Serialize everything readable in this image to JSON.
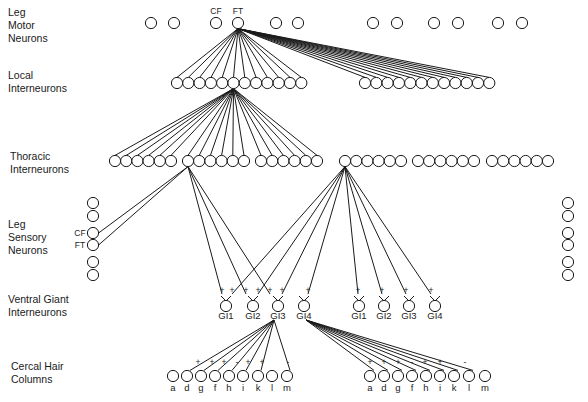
{
  "row_labels": {
    "motor": "Leg\nMotor\nNeurons",
    "local": "Local\nInterneurons",
    "thoracic": "Thoracic\nInterneurons",
    "sensory": "Leg\nSensory\nNeurons",
    "giant": "Ventral Giant\nInterneurons",
    "cercal": "Cercal Hair\nColumns"
  },
  "motor_neurons": {
    "y": 23,
    "x": [
      151,
      174,
      216,
      238,
      276,
      298,
      373,
      397,
      434,
      458,
      498,
      522
    ],
    "labels": [
      {
        "text": "CF",
        "x": 216
      },
      {
        "text": "FT",
        "x": 238
      }
    ],
    "source_index": 3
  },
  "local_interneurons": {
    "y": 83,
    "left_x_start": 177,
    "right_x_start": 365,
    "count_per_group": 12,
    "spacing": 11.3,
    "hub_index": 5
  },
  "thoracic_interneurons": {
    "y": 161,
    "groups_x_start": [
      115,
      188,
      261,
      345,
      418,
      492
    ],
    "count_per_group": 6,
    "spacing": 11.2
  },
  "sensory_left": {
    "x": 93,
    "y": [
      203,
      216,
      233,
      245,
      262,
      275
    ],
    "labels": [
      {
        "text": "CF",
        "index": 2
      },
      {
        "text": "FT",
        "index": 3
      }
    ]
  },
  "sensory_right": {
    "x": 568,
    "y": [
      203,
      216,
      233,
      245,
      262,
      275
    ]
  },
  "giant_interneurons": {
    "y": 306,
    "left": [
      {
        "label": "GI1",
        "x": 226
      },
      {
        "label": "GI2",
        "x": 253
      },
      {
        "label": "GI3",
        "x": 278
      },
      {
        "label": "GI4",
        "x": 304
      }
    ],
    "right": [
      {
        "label": "GI1",
        "x": 359
      },
      {
        "label": "GI2",
        "x": 384
      },
      {
        "label": "GI3",
        "x": 409
      },
      {
        "label": "GI4",
        "x": 435
      }
    ],
    "input_signs": [
      {
        "x": 222,
        "s": "+"
      },
      {
        "x": 232,
        "s": "+"
      },
      {
        "x": 246,
        "s": "+"
      },
      {
        "x": 258,
        "s": "+"
      },
      {
        "x": 270,
        "s": "+"
      },
      {
        "x": 282,
        "s": "+"
      },
      {
        "x": 308,
        "s": "+"
      },
      {
        "x": 358,
        "s": "+"
      },
      {
        "x": 382,
        "s": "+"
      },
      {
        "x": 406,
        "s": "+"
      },
      {
        "x": 431,
        "s": "+"
      }
    ]
  },
  "cercal_hairs": {
    "y": 376,
    "labels": [
      "a",
      "d",
      "g",
      "f",
      "h",
      "i",
      "k",
      "l",
      "m"
    ],
    "left_x": [
      173,
      187,
      201,
      215,
      229,
      243,
      258,
      272,
      287
    ],
    "right_x": [
      370,
      384,
      398,
      412,
      426,
      440,
      454,
      469,
      485
    ],
    "left_signs": [
      {
        "x": 198,
        "s": "+"
      },
      {
        "x": 212,
        "s": "+"
      },
      {
        "x": 224,
        "s": "+"
      },
      {
        "x": 237,
        "s": "-"
      },
      {
        "x": 248,
        "s": "+"
      },
      {
        "x": 262,
        "s": "+"
      },
      {
        "x": 288,
        "s": "-"
      }
    ],
    "right_signs": [
      {
        "x": 370,
        "s": "+"
      },
      {
        "x": 384,
        "s": "+"
      },
      {
        "x": 398,
        "s": "+"
      },
      {
        "x": 412,
        "s": "-"
      },
      {
        "x": 425,
        "s": "+"
      },
      {
        "x": 440,
        "s": "+"
      },
      {
        "x": 465,
        "s": "-"
      }
    ]
  },
  "colors": {
    "stroke": "#1a1a1a",
    "background": "#ffffff"
  }
}
